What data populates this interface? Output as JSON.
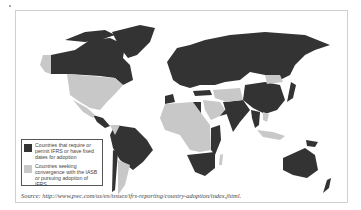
{
  "map": {
    "title": "World map of IFRS adoption",
    "colors": {
      "require_permit": "#333333",
      "convergence": "#c8c8c8",
      "background": "#ffffff",
      "frame": "#cfcfcf"
    }
  },
  "legend": {
    "items": [
      {
        "label": "Countries that require or permit IFRS or have fixed dates for adoption",
        "color": "#333333"
      },
      {
        "label": "Countries seeking convergence with the IASB or pursuing adoption of IFRS",
        "color": "#c8c8c8"
      }
    ]
  },
  "source": {
    "text": "Source: http://www.pwc.com/us/en/issues/ifrs-reporting/country-adoption/index.jhtml."
  }
}
